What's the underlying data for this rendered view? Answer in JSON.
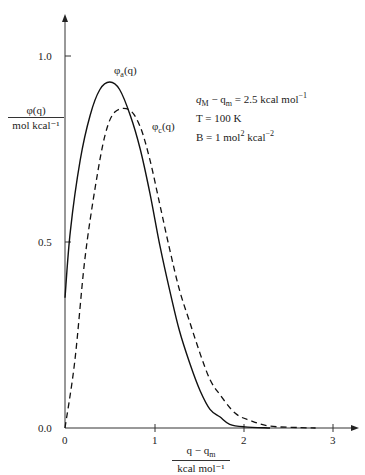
{
  "chart_data": {
    "type": "line",
    "title": "",
    "xlabel": "(q − q_m) / kcal mol⁻¹",
    "ylabel": "φ(q) / mol kcal⁻¹",
    "xlim": [
      0,
      3.2
    ],
    "ylim": [
      0,
      1.1
    ],
    "x_ticks": [
      "0",
      "1",
      "2",
      "3"
    ],
    "y_ticks": [
      "0.0",
      "0.5",
      "1.0"
    ],
    "grid": false,
    "legend": "inline curve labels",
    "series": [
      {
        "name": "φa(q)",
        "style": "solid",
        "x": [
          0.0,
          0.06,
          0.17,
          0.28,
          0.39,
          0.5,
          0.61,
          0.73,
          0.84,
          0.95,
          1.06,
          1.17,
          1.28,
          1.4,
          1.51,
          1.62,
          1.73,
          1.84,
          2.01,
          2.29
        ],
        "y": [
          0.35,
          0.53,
          0.72,
          0.84,
          0.91,
          0.93,
          0.91,
          0.84,
          0.75,
          0.63,
          0.49,
          0.37,
          0.26,
          0.17,
          0.1,
          0.05,
          0.03,
          0.01,
          0.003,
          0.0
        ]
      },
      {
        "name": "φc(q)",
        "style": "dashed",
        "x": [
          0.0,
          0.11,
          0.22,
          0.34,
          0.45,
          0.56,
          0.72,
          0.84,
          0.95,
          1.06,
          1.17,
          1.28,
          1.4,
          1.51,
          1.62,
          1.73,
          1.9,
          2.07,
          2.29,
          2.63,
          2.8
        ],
        "y": [
          0.0,
          0.18,
          0.45,
          0.65,
          0.79,
          0.85,
          0.855,
          0.81,
          0.72,
          0.6,
          0.48,
          0.37,
          0.28,
          0.2,
          0.13,
          0.09,
          0.04,
          0.02,
          0.005,
          0.001,
          0.0
        ]
      }
    ],
    "annotations": [
      "q_M − q_m = 2.5 kcal mol⁻¹",
      "T = 100 K",
      "B = 1 mol² kcal⁻²"
    ]
  },
  "labels": {
    "ylabel_num": "φ(q)",
    "ylabel_den": "mol kcal⁻¹",
    "xlabel_num": "q − q",
    "xlabel_num_sub": "m",
    "xlabel_den": "kcal mol⁻¹",
    "series_a": "φ",
    "series_a_sub": "a",
    "series_a_arg": "(q)",
    "series_c": "φ",
    "series_c_sub": "c",
    "series_c_arg": "(q)",
    "ann1_a": "q",
    "ann1_a_sub": "M",
    "ann1_b": " − q",
    "ann1_b_sub": "m",
    "ann1_c": " = 2.5 kcal mol",
    "ann1_c_sup": "−1",
    "ann2": "T = 100 K",
    "ann3_a": "B = 1 mol",
    "ann3_a_sup": "2",
    "ann3_b": " kcal",
    "ann3_b_sup": "−2",
    "ytick_0": "0.0",
    "ytick_05": "0.5",
    "ytick_1": "1.0",
    "xtick_0": "0",
    "xtick_1": "1",
    "xtick_2": "2",
    "xtick_3": "3"
  }
}
